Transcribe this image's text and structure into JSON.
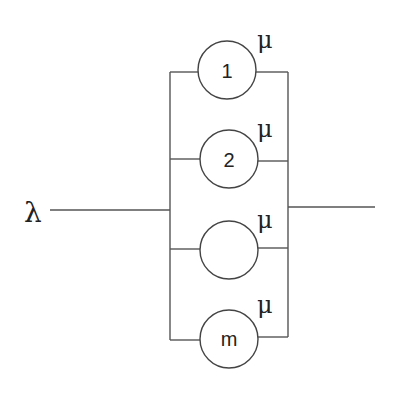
{
  "diagram": {
    "type": "parallel-server-queue",
    "arrival_rate_label": "λ",
    "service_rate_label": "μ",
    "servers": [
      {
        "label": "1",
        "rate": "μ"
      },
      {
        "label": "2",
        "rate": "μ"
      },
      {
        "label": "",
        "rate": "μ"
      },
      {
        "label": "m",
        "rate": "μ"
      }
    ]
  }
}
